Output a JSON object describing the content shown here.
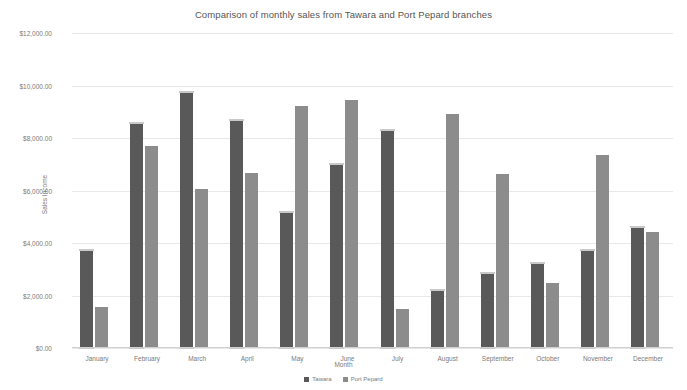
{
  "chart_data": {
    "type": "bar",
    "title": "Comparison of monthly sales from Tawara and Port Pepard branches",
    "xlabel": "Month",
    "ylabel": "Sales Income",
    "ylim": [
      0,
      12000
    ],
    "ytick_values": [
      0,
      2000,
      4000,
      6000,
      8000,
      10000,
      12000
    ],
    "ytick_labels": [
      "$0.00",
      "$2,000.00",
      "$4,000.00",
      "$6,000.00",
      "$8,000.00",
      "$10,000.00",
      "$12,000.00"
    ],
    "grid": true,
    "legend_position": "bottom",
    "categories": [
      "January",
      "February",
      "March",
      "April",
      "May",
      "June",
      "July",
      "August",
      "September",
      "October",
      "November",
      "December"
    ],
    "series": [
      {
        "name": "Tawara",
        "color": "#595959",
        "values": [
          3730,
          8560,
          9750,
          8700,
          5180,
          7010,
          8300,
          2200,
          2850,
          3230,
          3730,
          4620
        ]
      },
      {
        "name": "Port Pepard",
        "color": "#8c8c8c",
        "values": [
          1560,
          7680,
          6060,
          6680,
          9220,
          9450,
          1500,
          8900,
          6620,
          2480,
          7350,
          4430
        ]
      }
    ]
  },
  "colors": {
    "series_1": "#595959",
    "series_2": "#8c8c8c",
    "gridline": "#e8e8e8",
    "text": "#7a7a7a",
    "background": "#ffffff"
  }
}
